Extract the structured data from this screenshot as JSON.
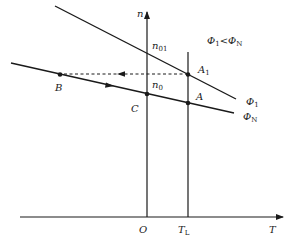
{
  "diagram": {
    "title": "",
    "axes": {
      "y_label": "n",
      "x_label": "T",
      "origin_label": "O",
      "load_label": "T",
      "load_label_sub": "L"
    },
    "condition": {
      "lhs": "Φ",
      "lhs_sub": "1",
      "op": "<",
      "rhs": "Φ",
      "rhs_sub": "N"
    },
    "curves": [
      {
        "name": "Φ",
        "sub": "1",
        "desc": "weakened-flux characteristic"
      },
      {
        "name": "Φ",
        "sub": "N",
        "desc": "rated-flux characteristic"
      }
    ],
    "points": {
      "n01": {
        "main": "n",
        "sub": "01"
      },
      "n0": {
        "main": "n",
        "sub": "0"
      },
      "A1": {
        "main": "A",
        "sub": "1"
      },
      "A": {
        "main": "A"
      },
      "B": {
        "main": "B"
      },
      "C": {
        "main": "C"
      }
    },
    "colors": {
      "line": "#1a1a1a",
      "background": "#ffffff"
    }
  }
}
